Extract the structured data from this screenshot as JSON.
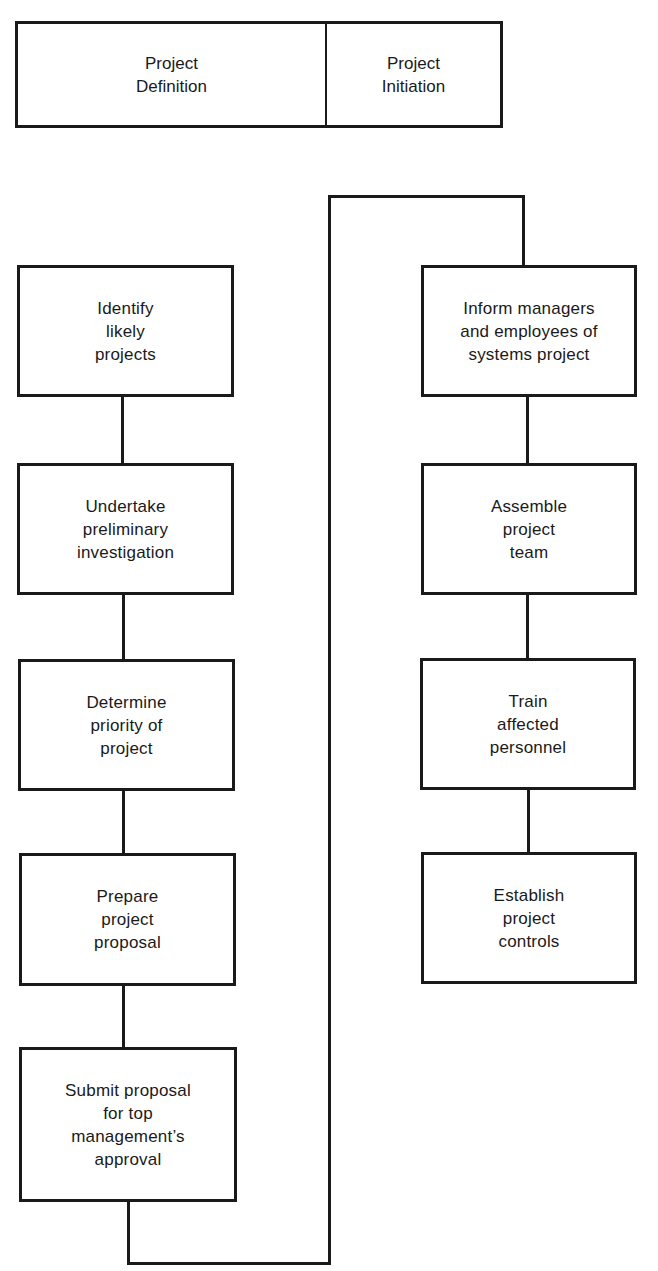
{
  "diagram": {
    "header": {
      "left": "Project\nDefinition",
      "right": "Project\nInitiation"
    },
    "definition_steps": [
      {
        "label": "Identify\nlikely\nprojects"
      },
      {
        "label": "Undertake\npreliminary\ninvestigation"
      },
      {
        "label": "Determine\npriority of\nproject"
      },
      {
        "label": "Prepare\nproject\nproposal"
      },
      {
        "label": "Submit proposal\nfor top\nmanagement’s\napproval"
      }
    ],
    "initiation_steps": [
      {
        "label": "Inform managers\nand employees of\nsystems project"
      },
      {
        "label": "Assemble\nproject\nteam"
      },
      {
        "label": "Train\naffected\npersonnel"
      },
      {
        "label": "Establish\nproject\ncontrols"
      }
    ],
    "colors": {
      "line": "#1a1a1a",
      "background": "#ffffff"
    }
  }
}
